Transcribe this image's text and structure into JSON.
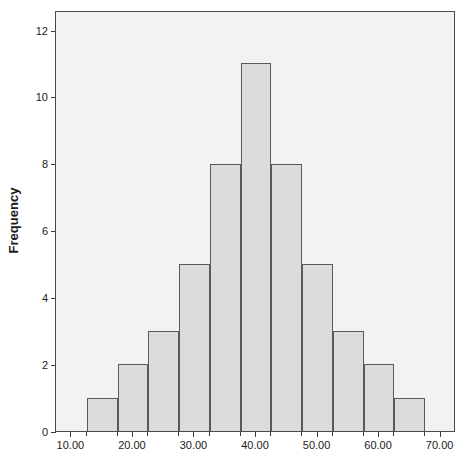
{
  "chart_data": {
    "type": "bar",
    "title": "",
    "subtitle": "",
    "xlabel": "",
    "ylabel": "Frequency",
    "grid": false,
    "legend": null,
    "bin_width": 5,
    "bin_starts": [
      12.5,
      17.5,
      22.5,
      27.5,
      32.5,
      37.5,
      42.5,
      47.5,
      52.5,
      57.5,
      62.5
    ],
    "bin_ends": [
      17.5,
      22.5,
      27.5,
      32.5,
      37.5,
      42.5,
      47.5,
      52.5,
      57.5,
      62.5,
      67.5
    ],
    "categories": [
      "12.5-17.5",
      "17.5-22.5",
      "22.5-27.5",
      "27.5-32.5",
      "32.5-37.5",
      "37.5-42.5",
      "42.5-47.5",
      "47.5-52.5",
      "52.5-57.5",
      "57.5-62.5",
      "62.5-67.5"
    ],
    "values": [
      1,
      2,
      3,
      5,
      8,
      11,
      8,
      5,
      3,
      2,
      1
    ],
    "xlim": [
      7.5,
      72.5
    ],
    "ylim": [
      0,
      12.6
    ],
    "xticks": [
      10,
      20,
      30,
      40,
      50,
      60,
      70
    ],
    "xtick_labels": [
      "10.00",
      "20.00",
      "30.00",
      "40.00",
      "50.00",
      "60.00",
      "70.00"
    ],
    "yticks": [
      0,
      2,
      4,
      6,
      8,
      10,
      12
    ],
    "ytick_labels": [
      "0",
      "2",
      "4",
      "6",
      "8",
      "10",
      "12"
    ],
    "total_count": 49,
    "colors": {
      "bar_fill": "#dcdcdc",
      "bar_border": "#5a5a5a",
      "plot_background": "#f2f2f2",
      "frame": "#4a4a4a",
      "text": "#1a1a1a",
      "page_background": "#ffffff"
    }
  }
}
